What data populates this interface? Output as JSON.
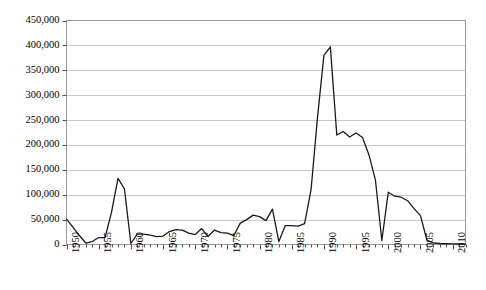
{
  "chart_data": {
    "type": "line",
    "title": "",
    "subtitle": "",
    "xlabel": "",
    "ylabel": "",
    "grid": "horizontal",
    "legend": "none",
    "xlim": [
      1950,
      2012
    ],
    "ylim": [
      0,
      450000
    ],
    "y_ticks": [
      0,
      50000,
      100000,
      150000,
      200000,
      250000,
      300000,
      350000,
      400000,
      450000
    ],
    "y_tick_labels": [
      "0",
      "50,000",
      "100,000",
      "150,000",
      "200,000",
      "250,000",
      "300,000",
      "350,000",
      "400,000",
      "450,000"
    ],
    "x_ticks_major": [
      1950,
      1955,
      1960,
      1965,
      1970,
      1975,
      1980,
      1985,
      1990,
      1995,
      2000,
      2005,
      2010
    ],
    "x_tick_labels": [
      "1950",
      "1955",
      "1960",
      "1965",
      "1970",
      "1975",
      "1980",
      "1985",
      "1990",
      "1995",
      "2000",
      "2005",
      "2010"
    ],
    "x_tick_interval_minor": 1,
    "line_color": "#1a1a1a",
    "line_width": 1.3,
    "series": [
      {
        "name": "series-1",
        "x": [
          1950,
          1951,
          1952,
          1953,
          1954,
          1955,
          1956,
          1957,
          1958,
          1959,
          1960,
          1961,
          1962,
          1963,
          1964,
          1965,
          1966,
          1967,
          1968,
          1969,
          1970,
          1971,
          1972,
          1973,
          1974,
          1975,
          1976,
          1977,
          1978,
          1979,
          1980,
          1981,
          1982,
          1983,
          1984,
          1985,
          1986,
          1987,
          1988,
          1989,
          1990,
          1991,
          1992,
          1993,
          1994,
          1995,
          1996,
          1997,
          1998,
          1999,
          2000,
          2001,
          2002,
          2003,
          2004,
          2005,
          2006,
          2007,
          2008,
          2009,
          2010,
          2011,
          2012
        ],
        "values": [
          51000,
          35000,
          18000,
          3000,
          6000,
          14000,
          14000,
          65000,
          133000,
          112000,
          2000,
          21000,
          21000,
          19000,
          16000,
          17000,
          26000,
          30000,
          29000,
          23000,
          20000,
          32000,
          16000,
          29000,
          24000,
          23000,
          18000,
          43000,
          50000,
          59000,
          56000,
          48000,
          71000,
          6000,
          38000,
          38000,
          37000,
          42000,
          110000,
          255000,
          380000,
          397000,
          220000,
          227000,
          216000,
          224000,
          215000,
          180000,
          130000,
          8000,
          105000,
          97000,
          95000,
          88000,
          72000,
          58000,
          9000,
          3000,
          2000,
          1500,
          1200,
          1000,
          900
        ]
      }
    ]
  },
  "axis": {
    "y_label_0": "0",
    "y_label_1": "50,000",
    "y_label_2": "100,000",
    "y_label_3": "150,000",
    "y_label_4": "200,000",
    "y_label_5": "250,000",
    "y_label_6": "300,000",
    "y_label_7": "350,000",
    "y_label_8": "400,000",
    "y_label_9": "450,000"
  }
}
